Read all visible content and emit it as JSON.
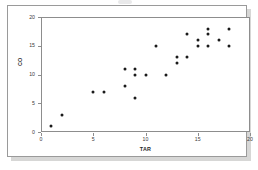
{
  "chart_data": {
    "type": "scatter",
    "title": "",
    "xlabel": "TAR",
    "ylabel": "CO",
    "xlim": [
      0,
      20
    ],
    "ylim": [
      0,
      20
    ],
    "xticks": [
      0,
      5,
      10,
      15,
      20
    ],
    "yticks": [
      0,
      5,
      10,
      15,
      20
    ],
    "grid": false,
    "legend": false,
    "marker": "filled-circle",
    "marker_color": "#1a1a1a",
    "points": [
      {
        "x": 1,
        "y": 1
      },
      {
        "x": 2,
        "y": 3
      },
      {
        "x": 5,
        "y": 7
      },
      {
        "x": 6,
        "y": 7
      },
      {
        "x": 8,
        "y": 11
      },
      {
        "x": 8,
        "y": 8
      },
      {
        "x": 9,
        "y": 11
      },
      {
        "x": 9,
        "y": 10
      },
      {
        "x": 9,
        "y": 6
      },
      {
        "x": 10,
        "y": 10
      },
      {
        "x": 11,
        "y": 15
      },
      {
        "x": 12,
        "y": 10
      },
      {
        "x": 13,
        "y": 13
      },
      {
        "x": 13,
        "y": 12
      },
      {
        "x": 14,
        "y": 17
      },
      {
        "x": 14,
        "y": 13
      },
      {
        "x": 15,
        "y": 16
      },
      {
        "x": 15,
        "y": 15
      },
      {
        "x": 16,
        "y": 18
      },
      {
        "x": 16,
        "y": 17
      },
      {
        "x": 16,
        "y": 15
      },
      {
        "x": 17,
        "y": 16
      },
      {
        "x": 18,
        "y": 18
      },
      {
        "x": 18,
        "y": 15
      }
    ]
  },
  "axes": {
    "x_tick_labels": [
      "0",
      "5",
      "10",
      "15",
      "20"
    ],
    "y_tick_labels": [
      "0",
      "5",
      "10",
      "15",
      "20"
    ],
    "x_title": "TAR",
    "y_title": "CO"
  },
  "colors": {
    "marker": "#1a1a1a",
    "axis": "#8d8d8d",
    "panel_border": "#9a9a9a",
    "shadow": "#d7d7d6",
    "background": "#ffffff",
    "tick_text": "#3a3a3a"
  }
}
